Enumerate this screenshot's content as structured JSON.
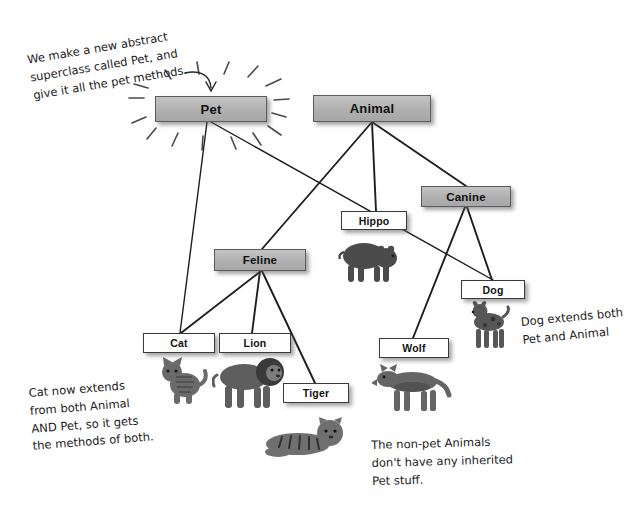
{
  "diagram": {
    "colors": {
      "abstract_fill": "#b5b5b5",
      "concrete_fill": "#ffffff",
      "stroke": "#2b2b2b",
      "background": "#ffffff",
      "text": "#111111"
    },
    "nodes": [
      {
        "id": "pet",
        "label": "Pet",
        "kind": "abstract",
        "x": 155,
        "y": 96,
        "w": 112,
        "h": 26
      },
      {
        "id": "animal",
        "label": "Animal",
        "kind": "abstract",
        "x": 313,
        "y": 95,
        "w": 118,
        "h": 27
      },
      {
        "id": "canine",
        "label": "Canine",
        "kind": "abstract",
        "x": 421,
        "y": 186,
        "w": 90,
        "h": 21
      },
      {
        "id": "feline",
        "label": "Feline",
        "kind": "abstract",
        "x": 214,
        "y": 249,
        "w": 92,
        "h": 22
      },
      {
        "id": "hippo",
        "label": "Hippo",
        "kind": "concrete",
        "x": 341,
        "y": 211,
        "w": 66,
        "h": 19
      },
      {
        "id": "dog",
        "label": "Dog",
        "kind": "concrete",
        "x": 461,
        "y": 280,
        "w": 64,
        "h": 19
      },
      {
        "id": "cat",
        "label": "Cat",
        "kind": "concrete",
        "x": 143,
        "y": 333,
        "w": 72,
        "h": 20
      },
      {
        "id": "lion",
        "label": "Lion",
        "kind": "concrete",
        "x": 219,
        "y": 333,
        "w": 72,
        "h": 20
      },
      {
        "id": "wolf",
        "label": "Wolf",
        "kind": "concrete",
        "x": 379,
        "y": 338,
        "w": 70,
        "h": 20
      },
      {
        "id": "tiger",
        "label": "Tiger",
        "kind": "concrete",
        "x": 283,
        "y": 383,
        "w": 66,
        "h": 20
      }
    ],
    "edges": [
      {
        "from": "animal",
        "to": "feline"
      },
      {
        "from": "animal",
        "to": "hippo"
      },
      {
        "from": "animal",
        "to": "canine"
      },
      {
        "from": "pet",
        "to": "cat"
      },
      {
        "from": "pet",
        "to": "dog"
      },
      {
        "from": "feline",
        "to": "cat"
      },
      {
        "from": "feline",
        "to": "lion"
      },
      {
        "from": "feline",
        "to": "tiger"
      },
      {
        "from": "canine",
        "to": "dog"
      },
      {
        "from": "canine",
        "to": "wolf"
      }
    ],
    "annotations": [
      {
        "id": "note-pet",
        "text": "We make a new abstract\nsuperclass called Pet, and\ngive it all the pet methods.",
        "x": 26,
        "y": 52,
        "tilt": "tilt-a"
      },
      {
        "id": "note-dog",
        "text": "Dog extends both\nPet and Animal",
        "x": 520,
        "y": 314,
        "tilt": "tilt-c"
      },
      {
        "id": "note-cat",
        "text": "Cat now extends\nfrom both Animal\nAND Pet, so it gets\nthe methods of both.",
        "x": 28,
        "y": 385,
        "tilt": "tilt-b"
      },
      {
        "id": "note-nonpet",
        "text": "The non-pet Animals\ndon't have any inherited\nPet stuff.",
        "x": 371,
        "y": 437,
        "tilt": "tilt-d"
      }
    ],
    "photos": [
      {
        "id": "photo-hippo",
        "name": "hippo-photo",
        "x": 336,
        "y": 236,
        "w": 62,
        "h": 48
      },
      {
        "id": "photo-dog",
        "name": "dog-photo",
        "x": 463,
        "y": 300,
        "w": 52,
        "h": 52
      },
      {
        "id": "photo-cat",
        "name": "cat-photo",
        "x": 158,
        "y": 355,
        "w": 50,
        "h": 50
      },
      {
        "id": "photo-lion",
        "name": "lion-photo",
        "x": 212,
        "y": 353,
        "w": 74,
        "h": 56
      },
      {
        "id": "photo-tiger",
        "name": "tiger-photo",
        "x": 262,
        "y": 412,
        "w": 86,
        "h": 48
      },
      {
        "id": "photo-wolf",
        "name": "wolf-photo",
        "x": 372,
        "y": 362,
        "w": 80,
        "h": 50
      }
    ],
    "sunburst": {
      "name": "pet-highlight-rays",
      "center_x": 211,
      "center_y": 109
    },
    "pointer_arrow": {
      "name": "note-to-pet-arrow",
      "label": "curved arrow from note to Pet box"
    }
  }
}
